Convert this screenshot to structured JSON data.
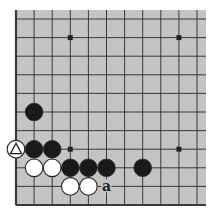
{
  "diagram": {
    "type": "go-board-fragment",
    "board_color": "#c4c4c4",
    "line_color": "#3a3a3a",
    "edges": [
      "left",
      "bottom"
    ],
    "columns_visible": 11,
    "rows_visible": 11,
    "star_points": [
      [
        3,
        1
      ],
      [
        9,
        1
      ],
      [
        3,
        7
      ],
      [
        9,
        7
      ]
    ],
    "stones": [
      {
        "color": "black",
        "col": 1,
        "row": 5
      },
      {
        "color": "white",
        "col": 0,
        "row": 7,
        "marker": "triangle"
      },
      {
        "color": "black",
        "col": 1,
        "row": 7
      },
      {
        "color": "black",
        "col": 2,
        "row": 7
      },
      {
        "color": "white",
        "col": 1,
        "row": 8
      },
      {
        "color": "white",
        "col": 2,
        "row": 8
      },
      {
        "color": "black",
        "col": 3,
        "row": 8
      },
      {
        "color": "black",
        "col": 4,
        "row": 8
      },
      {
        "color": "black",
        "col": 5,
        "row": 8
      },
      {
        "color": "black",
        "col": 7,
        "row": 8
      },
      {
        "color": "white",
        "col": 3,
        "row": 9
      },
      {
        "color": "white",
        "col": 4,
        "row": 9
      }
    ],
    "labels": [
      {
        "text": "a",
        "col": 5,
        "row": 9
      }
    ]
  }
}
